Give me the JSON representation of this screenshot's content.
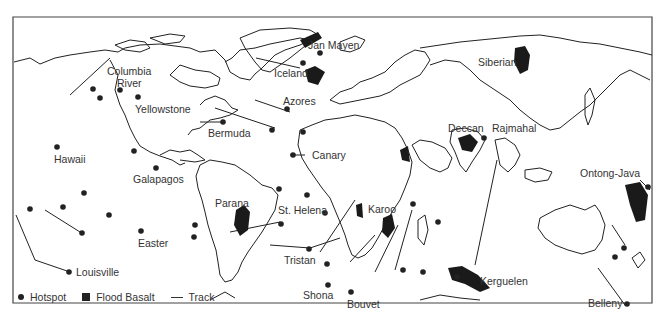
{
  "map": {
    "title": "",
    "frame_color": "#333333",
    "hotspot_color": "#222222",
    "basalt_color": "#1a1a1a",
    "labels": {
      "jan_mayen": "Jan Mayen",
      "iceland": "Iceland",
      "siberian": "Siberian",
      "columbia_river_1": "Columbia",
      "columbia_river_2": "River",
      "yellowstone": "Yellowstone",
      "azores": "Azores",
      "bermuda": "Bermuda",
      "hawaii": "Hawaii",
      "canary": "Canary",
      "deccan": "Deccan",
      "rajmahal": "Rajmahal",
      "galapagos": "Galapagos",
      "ontong_java": "Ontong-Java",
      "parana": "Parana",
      "st_helena": "St. Helena",
      "karoo": "Karoo",
      "easter": "Easter",
      "tristan": "Tristan",
      "louisville": "Louisville",
      "kerguelen": "Kerguelen",
      "shona": "Shona",
      "bouvet": "Bouvet",
      "belleny": "Belleny"
    }
  },
  "legend": {
    "hotspot": "Hotspot",
    "flood_basalt": "Flood Basalt",
    "track": "Track"
  }
}
